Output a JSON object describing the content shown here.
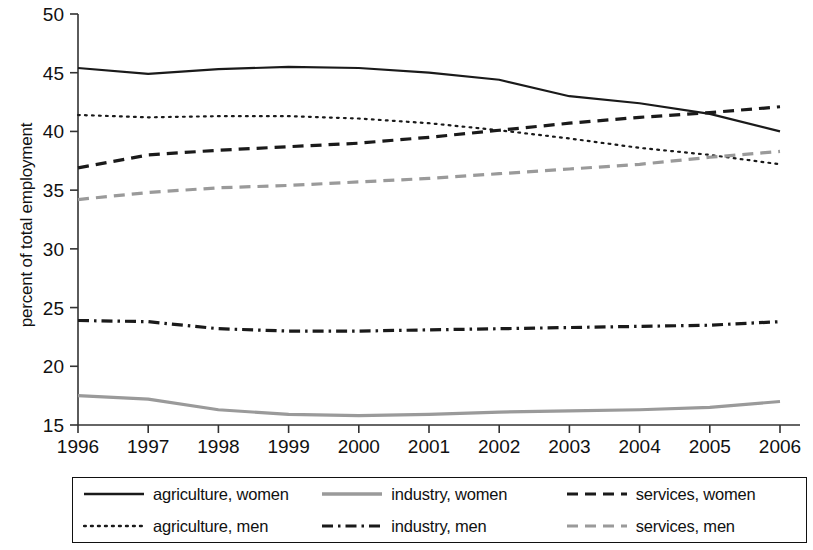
{
  "chart_data": {
    "type": "line",
    "title": "",
    "xlabel": "",
    "ylabel": "percent of total employment",
    "x": [
      1996,
      1997,
      1998,
      1999,
      2000,
      2001,
      2002,
      2003,
      2004,
      2005,
      2006
    ],
    "categories": [
      "1996",
      "1997",
      "1998",
      "1999",
      "2000",
      "2001",
      "2002",
      "2003",
      "2004",
      "2005",
      "2006"
    ],
    "ylim": [
      15,
      50
    ],
    "yticks": [
      15,
      20,
      25,
      30,
      35,
      40,
      45,
      50
    ],
    "ytick_labels": [
      "15",
      "20",
      "25",
      "30",
      "35",
      "40",
      "45",
      "50"
    ],
    "grid": false,
    "legend_position": "bottom",
    "series": [
      {
        "name": "agriculture, women",
        "style": "solid",
        "color": "#1a1a1a",
        "values": [
          45.4,
          44.9,
          45.3,
          45.5,
          45.4,
          45.0,
          44.4,
          43.0,
          42.4,
          41.5,
          40.0
        ]
      },
      {
        "name": "agriculture, men",
        "style": "dotted",
        "color": "#1a1a1a",
        "values": [
          41.4,
          41.2,
          41.3,
          41.3,
          41.1,
          40.7,
          40.1,
          39.4,
          38.6,
          38.0,
          37.2
        ]
      },
      {
        "name": "services, women",
        "style": "dashed",
        "color": "#1a1a1a",
        "values": [
          36.9,
          38.0,
          38.4,
          38.7,
          39.0,
          39.5,
          40.1,
          40.7,
          41.2,
          41.6,
          42.1
        ]
      },
      {
        "name": "industry, women",
        "style": "solid",
        "color": "#9a9a9a",
        "values": [
          17.5,
          17.2,
          16.3,
          15.9,
          15.8,
          15.9,
          16.1,
          16.2,
          16.3,
          16.5,
          17.0
        ]
      },
      {
        "name": "industry, men",
        "style": "dashdot",
        "color": "#1a1a1a",
        "values": [
          23.9,
          23.8,
          23.2,
          23.0,
          23.0,
          23.1,
          23.2,
          23.3,
          23.4,
          23.5,
          23.8
        ]
      },
      {
        "name": "services, men",
        "style": "dashed",
        "color": "#9a9a9a",
        "values": [
          34.2,
          34.8,
          35.2,
          35.4,
          35.7,
          36.0,
          36.4,
          36.8,
          37.2,
          37.8,
          38.3
        ]
      }
    ]
  },
  "legend": {
    "items": [
      {
        "label": "agriculture, women",
        "style": "solid",
        "color": "#1a1a1a"
      },
      {
        "label": "industry, women",
        "style": "solid",
        "color": "#9a9a9a"
      },
      {
        "label": "services, women",
        "style": "dashed",
        "color": "#1a1a1a"
      },
      {
        "label": "agriculture, men",
        "style": "dotted",
        "color": "#1a1a1a"
      },
      {
        "label": "industry, men",
        "style": "dashdot",
        "color": "#1a1a1a"
      },
      {
        "label": "services, men",
        "style": "dashed",
        "color": "#9a9a9a"
      }
    ]
  }
}
